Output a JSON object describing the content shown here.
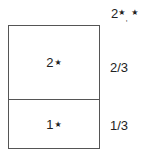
{
  "diagram": {
    "top_label": {
      "main": "2",
      "star": "★",
      "comma": ",",
      "star2": "★"
    },
    "cells": [
      {
        "label": "2",
        "marker": "★",
        "fraction": "2/3"
      },
      {
        "label": "1",
        "marker": "★",
        "fraction": "1/3"
      }
    ],
    "colors": {
      "border": "#555555",
      "text": "#222222",
      "background": "#ffffff"
    }
  }
}
